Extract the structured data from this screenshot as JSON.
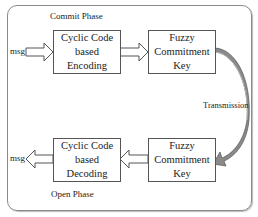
{
  "diagram": {
    "commit_phase_label": "Commit Phase",
    "open_phase_label": "Open Phase",
    "transmission_label": "Transmission",
    "msg_in_label": "msg",
    "msg_out_label": "msg",
    "top_row": {
      "encoding_box": {
        "line1": "Cyclic Code",
        "line2": "based Encoding"
      },
      "key_box": {
        "line1": "Fuzzy",
        "line2": "Commitment Key"
      }
    },
    "bottom_row": {
      "decoding_box": {
        "line1": "Cyclic Code",
        "line2": "based Decoding"
      },
      "key_box": {
        "line1": "Fuzzy",
        "line2": "Commitment Key"
      }
    }
  }
}
